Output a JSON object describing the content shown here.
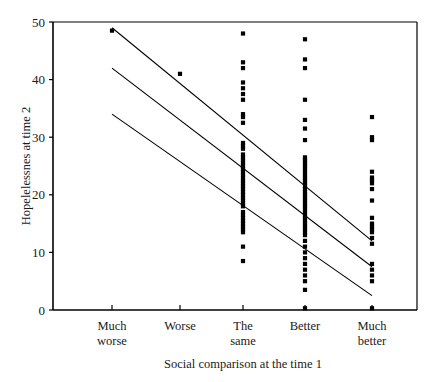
{
  "chart_data": {
    "type": "scatter",
    "title": "",
    "xlabel": "Social comparison at the time 1",
    "ylabel": "Hopelelessnes at time 2",
    "categories": [
      "Much worse",
      "Worse",
      "The same",
      "Better",
      "Much better"
    ],
    "category_labels_line1": [
      "Much",
      "Worse",
      "The",
      "Better",
      "Much"
    ],
    "category_labels_line2": [
      "worse",
      "",
      "same",
      "",
      "better"
    ],
    "ylim": [
      0,
      50
    ],
    "yticks": [
      0,
      10,
      20,
      30,
      40,
      50
    ],
    "ytick_labels": [
      "0",
      "10",
      "20",
      "30",
      "40",
      "50"
    ],
    "grid": false,
    "legend": "none",
    "marker": "filled-square",
    "marker_color": "#000000",
    "points": [
      {
        "category": "Much worse",
        "x": 1,
        "values": [
          48.5
        ]
      },
      {
        "category": "Worse",
        "x": 2,
        "values": [
          41.0
        ]
      },
      {
        "category": "The same",
        "x": 3,
        "values": [
          48.0,
          43.0,
          42.0,
          39.5,
          38.5,
          37.5,
          36.5,
          34.0,
          33.5,
          32.5,
          29.0,
          28.5,
          28.0,
          27.0,
          26.5,
          26.0,
          25.5,
          25.0,
          24.5,
          24.0,
          23.5,
          23.0,
          22.5,
          22.0,
          21.5,
          21.0,
          20.5,
          20.0,
          19.5,
          19.0,
          18.5,
          18.0,
          17.0,
          16.5,
          16.0,
          15.5,
          15.0,
          14.5,
          14.0,
          13.5,
          11.0,
          8.5
        ]
      },
      {
        "category": "Better",
        "x": 4,
        "values": [
          47.0,
          43.5,
          42.0,
          36.5,
          33.0,
          31.5,
          29.5,
          26.5,
          26.0,
          25.5,
          25.0,
          24.5,
          24.0,
          23.5,
          23.0,
          22.5,
          22.0,
          21.5,
          21.0,
          20.5,
          20.0,
          19.5,
          19.0,
          18.5,
          18.0,
          17.5,
          17.0,
          16.5,
          16.0,
          15.5,
          15.0,
          14.5,
          14.0,
          13.5,
          13.0,
          12.0,
          11.0,
          10.0,
          9.0,
          8.0,
          7.0,
          6.0,
          5.0,
          3.5,
          0.3
        ]
      },
      {
        "category": "Much better",
        "x": 5,
        "values": [
          33.5,
          30.0,
          29.5,
          24.0,
          23.0,
          22.5,
          22.0,
          21.0,
          19.0,
          16.0,
          15.0,
          14.5,
          14.0,
          13.5,
          12.5,
          11.5,
          8.0,
          7.0,
          6.0,
          5.0,
          0.3
        ]
      }
    ],
    "lines": [
      {
        "name": "upper-confidence-line",
        "x_start": 1,
        "y_start": 49.0,
        "x_end": 5,
        "y_end": 12.0
      },
      {
        "name": "regression-line",
        "x_start": 1,
        "y_start": 42.0,
        "x_end": 5,
        "y_end": 7.5
      },
      {
        "name": "lower-confidence-line",
        "x_start": 1,
        "y_start": 34.0,
        "x_end": 5,
        "y_end": 2.5
      }
    ]
  }
}
